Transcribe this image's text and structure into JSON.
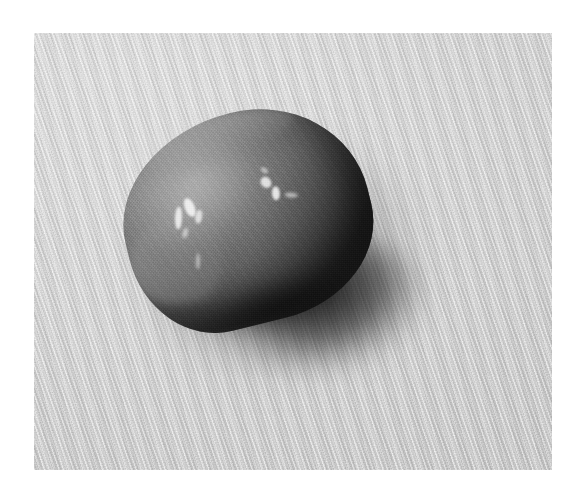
{
  "image": {
    "domain": "Natural-Image",
    "title": "Grayscale photograph of a single lemon resting on ribbed fabric",
    "caption": "",
    "color_mode": "grayscale",
    "canvas": {
      "width": 586,
      "height": 504,
      "background": "#ffffff"
    },
    "photo_plate": {
      "x": 34,
      "y": 33,
      "width": 518,
      "height": 437,
      "margin_color": "#ffffff"
    },
    "palette": {
      "page_white": "#ffffff",
      "cloth_light": "#e2e2e2",
      "cloth_mid": "#d4d4d4",
      "cloth_dark": "#c6c6c6",
      "fruit_highlight": "#f2f2f2",
      "fruit_light": "#9b9b9b",
      "fruit_mid": "#7e7e7e",
      "fruit_dark": "#3d3d3d",
      "shadow_core": "#1a1a1a"
    },
    "subjects": [
      {
        "name": "lemon",
        "label": "lemon",
        "shape": "ovoid with tapering point at lower-left",
        "bbox": {
          "x": 123,
          "y": 112,
          "width": 248,
          "height": 212
        },
        "rotation_deg": -14,
        "surface": "stippled citrus peel",
        "highlights": 2,
        "highlight_description": "two specular highlight clusters on the upper-left and upper-center of the peel"
      },
      {
        "name": "fabric-background",
        "label": "ribbed fabric cloth",
        "weave": "fine diagonal rib running lower-left to upper-right",
        "rib_angle_deg": 72,
        "moire": true
      },
      {
        "name": "cast-shadow",
        "label": "cast shadow",
        "direction": "lower-right",
        "softness": "soft with darker contact core"
      }
    ],
    "lighting": {
      "key_light_direction": "upper-left",
      "shadow_direction": "lower-right",
      "contrast": "medium"
    }
  }
}
